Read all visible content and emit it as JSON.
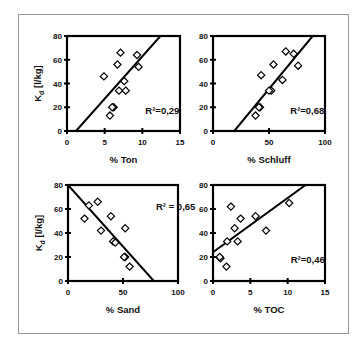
{
  "chart_data": [
    {
      "type": "scatter",
      "xlabel": "% Ton",
      "ylabel": "Kd [l/kg]",
      "ylabel_main": "K",
      "ylabel_sub": "d",
      "ylabel_rest": " [l/kg]",
      "xlim": [
        0,
        15
      ],
      "ylim": [
        0,
        80
      ],
      "xticks": [
        0,
        5,
        10,
        15
      ],
      "yticks": [
        0,
        20,
        40,
        60,
        80
      ],
      "annotation": "R²=0,29",
      "points": [
        [
          7.1,
          66
        ],
        [
          9.3,
          64
        ],
        [
          6.7,
          56
        ],
        [
          9.5,
          54
        ],
        [
          4.9,
          46
        ],
        [
          7.6,
          42
        ],
        [
          6.9,
          34
        ],
        [
          7.8,
          34
        ],
        [
          6.2,
          20
        ],
        [
          6.0,
          20
        ],
        [
          5.7,
          13
        ]
      ],
      "trendline": [
        [
          1.2,
          0
        ],
        [
          12.4,
          80
        ]
      ]
    },
    {
      "type": "scatter",
      "xlabel": "% Schluff",
      "ylabel": "",
      "xlim": [
        0,
        100
      ],
      "ylim": [
        0,
        80
      ],
      "xticks": [
        0,
        50,
        100
      ],
      "yticks": [
        0,
        20,
        40,
        60,
        80
      ],
      "annotation": "R²=0,68",
      "points": [
        [
          65,
          67
        ],
        [
          72,
          65
        ],
        [
          54,
          56
        ],
        [
          76,
          55
        ],
        [
          43,
          47
        ],
        [
          62,
          43
        ],
        [
          52,
          34
        ],
        [
          50,
          34
        ],
        [
          42,
          20
        ],
        [
          41,
          20
        ],
        [
          38,
          13
        ]
      ],
      "trendline": [
        [
          19,
          0
        ],
        [
          89,
          80
        ]
      ]
    },
    {
      "type": "scatter",
      "xlabel": "% Sand",
      "ylabel": "Kd [l/kg]",
      "ylabel_main": "K",
      "ylabel_sub": "d",
      "ylabel_rest": " [l/kg]",
      "xlim": [
        0,
        100
      ],
      "ylim": [
        0,
        80
      ],
      "xticks": [
        0,
        50,
        100
      ],
      "yticks": [
        0,
        20,
        40,
        60,
        80
      ],
      "annotation": "R² = 0,65",
      "points": [
        [
          27,
          66
        ],
        [
          19,
          63
        ],
        [
          15,
          52
        ],
        [
          39,
          54
        ],
        [
          52,
          44
        ],
        [
          30,
          42
        ],
        [
          41,
          33
        ],
        [
          43,
          32
        ],
        [
          52,
          20
        ],
        [
          51,
          20
        ],
        [
          56,
          12
        ]
      ],
      "trendline": [
        [
          0,
          80
        ],
        [
          78,
          0
        ]
      ]
    },
    {
      "type": "scatter",
      "xlabel": "% TOC",
      "ylabel": "",
      "xlim": [
        0,
        15
      ],
      "ylim": [
        0,
        80
      ],
      "xticks": [
        0,
        5,
        10,
        15
      ],
      "yticks": [
        0,
        20,
        40,
        60,
        80
      ],
      "annotation": "R²=0,46",
      "points": [
        [
          2.4,
          62
        ],
        [
          10.2,
          65
        ],
        [
          3.7,
          52
        ],
        [
          5.7,
          54
        ],
        [
          2.9,
          44
        ],
        [
          7.1,
          42
        ],
        [
          1.9,
          33
        ],
        [
          3.3,
          33
        ],
        [
          1.0,
          19
        ],
        [
          0.9,
          20
        ],
        [
          1.8,
          12
        ]
      ],
      "trendline": [
        [
          0,
          24
        ],
        [
          12.4,
          80
        ]
      ]
    }
  ],
  "layout": {
    "panels": [
      {
        "left": 67,
        "right": 180,
        "top": 36,
        "bottom": 131,
        "r2_x": 10.4,
        "r2_y": 14,
        "show_ylabel": true
      },
      {
        "left": 213,
        "right": 325,
        "top": 36,
        "bottom": 131,
        "r2_x": 69,
        "r2_y": 14,
        "show_ylabel": false
      },
      {
        "left": 68,
        "right": 178,
        "top": 185,
        "bottom": 281,
        "r2_x": 80,
        "r2_y": 59,
        "show_ylabel": true
      },
      {
        "left": 213,
        "right": 325,
        "top": 185,
        "bottom": 281,
        "r2_x": 10.4,
        "r2_y": 15,
        "show_ylabel": false
      }
    ],
    "colors": {
      "axis": "#000000",
      "marker": "#000000",
      "frame": "#9a9a9a"
    }
  }
}
